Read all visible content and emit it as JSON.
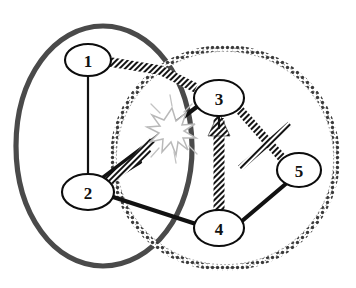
{
  "diagram": {
    "background_color": "#ffffff",
    "nodes": [
      {
        "id": "1",
        "label": "1",
        "cx": 88,
        "cy": 60,
        "rx": 23,
        "ry": 16
      },
      {
        "id": "2",
        "label": "2",
        "cx": 88,
        "cy": 192,
        "rx": 26,
        "ry": 18
      },
      {
        "id": "3",
        "label": "3",
        "cx": 219,
        "cy": 98,
        "rx": 25,
        "ry": 18
      },
      {
        "id": "4",
        "label": "4",
        "cx": 219,
        "cy": 228,
        "rx": 25,
        "ry": 18
      },
      {
        "id": "5",
        "label": "5",
        "cx": 299,
        "cy": 170,
        "rx": 22,
        "ry": 17
      }
    ],
    "edges": [
      {
        "from": "1",
        "to": "2",
        "style": "solid-thin",
        "color": "#121212"
      },
      {
        "from": "1",
        "to": "3",
        "style": "hatched",
        "color": "#141414"
      },
      {
        "from": "2",
        "to": "3",
        "style": "solid-thick",
        "color": "#121212"
      },
      {
        "from": "2",
        "to": "3",
        "style": "hatched",
        "color": "#141414"
      },
      {
        "from": "2",
        "to": "4",
        "style": "solid-thick",
        "color": "#121212"
      },
      {
        "from": "3",
        "to": "4",
        "style": "hatched",
        "color": "#141414"
      },
      {
        "from": "3",
        "to": "5",
        "style": "hatched",
        "color": "#141414"
      },
      {
        "from": "4",
        "to": "5",
        "style": "solid-thick",
        "color": "#121212"
      },
      {
        "from": "2",
        "to": "5",
        "style": "hatched",
        "color": "#141414"
      }
    ],
    "regions": [
      {
        "name": "left-region",
        "style": "thick-solid-gray",
        "color": "#4a4a4a",
        "cx": 105,
        "cy": 148,
        "rx": 90,
        "ry": 122,
        "rotation": -8
      },
      {
        "name": "right-region",
        "style": "beaded-dotted",
        "color": "#3c3c3c",
        "cx": 225,
        "cy": 158,
        "rx": 112,
        "ry": 110,
        "rotation": 0
      }
    ],
    "burst": {
      "name": "conflict-burst",
      "cx": 172,
      "cy": 128,
      "r": 21,
      "color": "#c2c2c2",
      "points": 12
    }
  }
}
